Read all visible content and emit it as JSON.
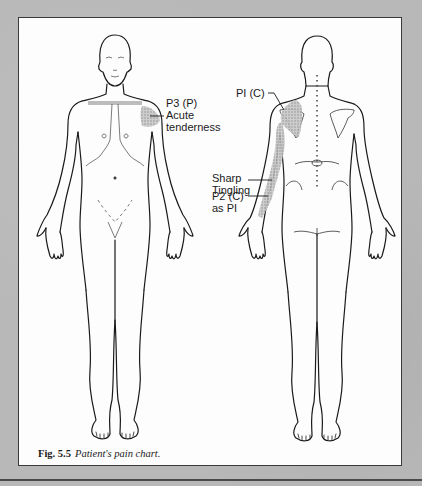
{
  "figure": {
    "number": "Fig. 5.5",
    "caption": "Patient's pain chart.",
    "views": [
      "anterior",
      "posterior"
    ]
  },
  "annotations": {
    "p3": {
      "line1": "P3 (P)",
      "line2": "Acute",
      "line3": "tenderness"
    },
    "p1": {
      "line1": "PI (C)"
    },
    "sharp": {
      "line1": "Sharp",
      "line2": "Tingling"
    },
    "p2": {
      "line1": "P2 (C)",
      "line2": "as PI"
    }
  },
  "colors": {
    "background": "#b8b8b8",
    "paper": "#fdfdfd",
    "ink": "#1a1a1a",
    "shading": "#9a9a9a"
  }
}
